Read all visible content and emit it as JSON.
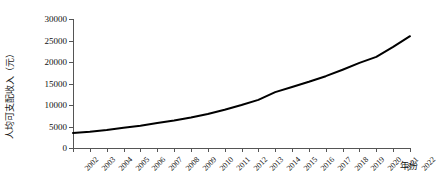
{
  "chart_data": {
    "type": "line",
    "title": "",
    "xlabel": "年份",
    "ylabel": "人均可支配收入（元）",
    "xlim": [
      2002,
      2022
    ],
    "ylim": [
      0,
      30000
    ],
    "ytick_labels": [
      "0",
      "5000",
      "10000",
      "15000",
      "20000",
      "25000",
      "30000"
    ],
    "ytick_values": [
      0,
      5000,
      10000,
      15000,
      20000,
      25000,
      30000
    ],
    "grid": false,
    "legend": "none",
    "line_color": "#000000",
    "line_width": 2,
    "categories": [
      "2002",
      "2003",
      "2004",
      "2005",
      "2006",
      "2007",
      "2008",
      "2009",
      "2010",
      "2011",
      "2012",
      "2013",
      "2014",
      "2015",
      "2016",
      "2017",
      "2018",
      "2019",
      "2020",
      "2021",
      "2022"
    ],
    "series": [
      {
        "name": "人均可支配收入",
        "values": [
          3500,
          3800,
          4200,
          4700,
          5200,
          5800,
          6400,
          7100,
          7900,
          8900,
          10000,
          11200,
          13000,
          14200,
          15400,
          16700,
          18200,
          19800,
          21200,
          23500,
          26000
        ]
      }
    ]
  }
}
